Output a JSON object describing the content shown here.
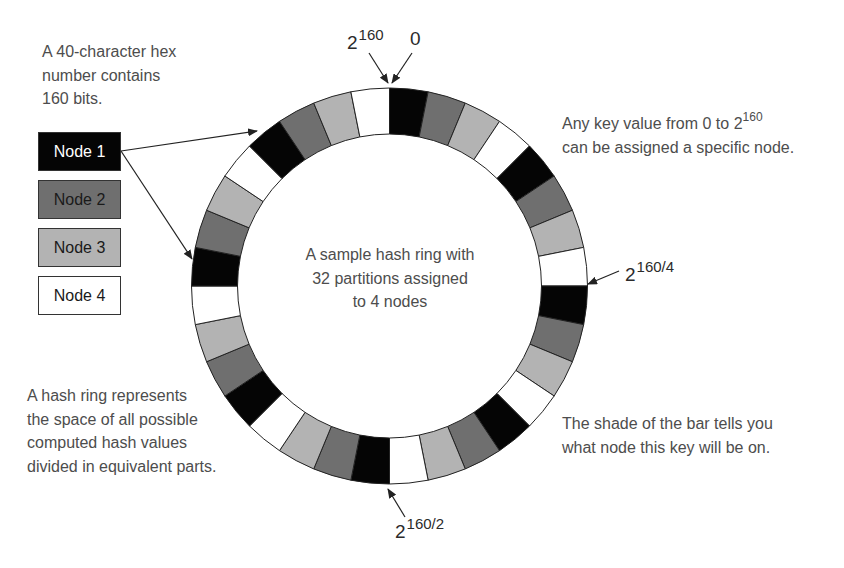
{
  "notes": {
    "hex_bits": [
      "A 40-character hex",
      "number contains",
      "160 bits."
    ],
    "any_key": [
      "Any key value from 0 to 2",
      "can be assigned a specific node."
    ],
    "any_key_sup": "160",
    "hash_ring": [
      "A hash ring represents",
      "the space of all possible",
      "computed hash values",
      "divided in equivalent parts."
    ],
    "shade": [
      "The shade of the bar tells you",
      "what node this key will be on."
    ]
  },
  "center": [
    "A sample hash ring with",
    "32 partitions assigned",
    "to 4 nodes"
  ],
  "legend": [
    {
      "label": "Node 1",
      "fill": "#050505",
      "text_color": "#ffffff"
    },
    {
      "label": "Node 2",
      "fill": "#6f6f6f",
      "text_color": "#1a1a1a"
    },
    {
      "label": "Node 3",
      "fill": "#b3b3b3",
      "text_color": "#1a1a1a"
    },
    {
      "label": "Node 4",
      "fill": "#ffffff",
      "text_color": "#1a1a1a"
    }
  ],
  "ring": {
    "partitions": 32,
    "node_count": 4,
    "assignment": [
      1,
      2,
      3,
      4,
      1,
      2,
      3,
      4,
      1,
      2,
      3,
      4,
      1,
      2,
      3,
      4,
      1,
      2,
      3,
      4,
      1,
      2,
      3,
      4,
      1,
      2,
      3,
      4,
      1,
      2,
      3,
      4
    ],
    "cx": 389.5,
    "cy": 286,
    "outer_r": 198,
    "inner_r": 152
  },
  "markers": {
    "top_max": {
      "base": "2",
      "sup": "160"
    },
    "top_zero": {
      "base": "0"
    },
    "quarter": {
      "base": "2",
      "sup": "160/4"
    },
    "half": {
      "base": "2",
      "sup": "160/2"
    }
  }
}
